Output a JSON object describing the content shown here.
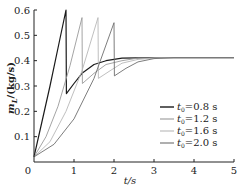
{
  "chart_data": {
    "type": "line",
    "title": "",
    "xlabel": "t/s",
    "ylabel": "m_L/(kg/s)",
    "xlim": [
      0,
      5
    ],
    "ylim": [
      0,
      0.6
    ],
    "x_ticks": [
      "0",
      "1",
      "2",
      "3",
      "4",
      "5"
    ],
    "y_ticks": [
      "0.1",
      "0.2",
      "0.3",
      "0.4",
      "0.5",
      "0.6"
    ],
    "grid": false,
    "legend_position": "lower right",
    "series": [
      {
        "name": "t0=0.8 s",
        "color": "#1a1a1a",
        "width": 1.2,
        "points": [
          [
            0,
            0.02
          ],
          [
            0.2,
            0.16
          ],
          [
            0.4,
            0.3
          ],
          [
            0.6,
            0.45
          ],
          [
            0.8,
            0.6
          ],
          [
            0.81,
            0.27
          ],
          [
            1.0,
            0.31
          ],
          [
            1.2,
            0.35
          ],
          [
            1.5,
            0.385
          ],
          [
            1.8,
            0.4
          ],
          [
            2.2,
            0.41
          ],
          [
            3,
            0.412
          ],
          [
            5,
            0.412
          ]
        ]
      },
      {
        "name": "t0=1.2 s",
        "color": "#9a9a9a",
        "width": 0.9,
        "points": [
          [
            0,
            0.02
          ],
          [
            0.3,
            0.1
          ],
          [
            0.6,
            0.22
          ],
          [
            0.9,
            0.38
          ],
          [
            1.2,
            0.57
          ],
          [
            1.21,
            0.31
          ],
          [
            1.5,
            0.35
          ],
          [
            1.8,
            0.385
          ],
          [
            2.2,
            0.4
          ],
          [
            2.6,
            0.41
          ],
          [
            3.2,
            0.412
          ],
          [
            5,
            0.412
          ]
        ]
      },
      {
        "name": "t0=1.6 s",
        "color": "#b8b8b8",
        "width": 0.9,
        "points": [
          [
            0,
            0.02
          ],
          [
            0.4,
            0.08
          ],
          [
            0.8,
            0.2
          ],
          [
            1.2,
            0.36
          ],
          [
            1.6,
            0.57
          ],
          [
            1.61,
            0.33
          ],
          [
            1.9,
            0.36
          ],
          [
            2.2,
            0.39
          ],
          [
            2.6,
            0.405
          ],
          [
            3.0,
            0.41
          ],
          [
            3.5,
            0.412
          ],
          [
            5,
            0.412
          ]
        ]
      },
      {
        "name": "t0=2.0 s",
        "color": "#6e6e6e",
        "width": 0.9,
        "points": [
          [
            0,
            0.02
          ],
          [
            0.5,
            0.07
          ],
          [
            1.0,
            0.17
          ],
          [
            1.5,
            0.33
          ],
          [
            2.0,
            0.55
          ],
          [
            2.01,
            0.34
          ],
          [
            2.3,
            0.37
          ],
          [
            2.6,
            0.395
          ],
          [
            3.0,
            0.408
          ],
          [
            3.5,
            0.412
          ],
          [
            5,
            0.412
          ]
        ]
      }
    ]
  },
  "axes": {
    "xlabel": "t/s",
    "ylabel_main": "m",
    "ylabel_sub": "L",
    "ylabel_rest": "/(kg/s)",
    "origin_label": "0"
  },
  "legend": [
    {
      "label_t": "t",
      "label_sub": "0",
      "label_rest": "=0.8 s"
    },
    {
      "label_t": "t",
      "label_sub": "0",
      "label_rest": "=1.2 s"
    },
    {
      "label_t": "t",
      "label_sub": "0",
      "label_rest": "=1.6 s"
    },
    {
      "label_t": "t",
      "label_sub": "0",
      "label_rest": "=2.0 s"
    }
  ]
}
